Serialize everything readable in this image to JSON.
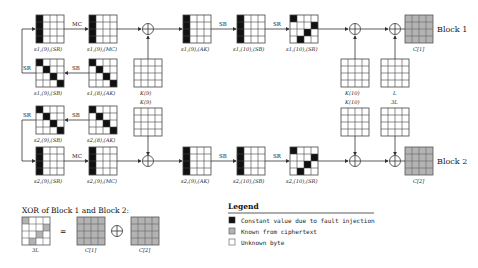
{
  "legend": {
    "title": "Legend",
    "items": [
      {
        "color": "#111111",
        "label": "Constant value due to fault injection"
      },
      {
        "color": "#b3b3b3",
        "label": "Known from ciphertext"
      },
      {
        "color": "#ffffff",
        "label": "Unknown byte"
      }
    ]
  },
  "colors": {
    "fault": "#111111",
    "known": "#b3b3b3",
    "unknown": "#ffffff",
    "line": "#333333"
  },
  "operations": {
    "mc": "MC",
    "sb": "SB",
    "sr": "SR"
  },
  "block1": {
    "name": "Block 1",
    "states": {
      "s9_sr": "s1,(9),(SR)",
      "s9_mc": "s1,(9),(MC)",
      "s9_ak": "s1,(9),(AK)",
      "s10_sb": "s1,(10),(SB)",
      "s10_sr": "s1,(10),(SR)",
      "s9_sb": "s1,(9),(SB)",
      "s8_ak": "s1,(8),(AK)"
    },
    "keys": {
      "k9": "K(9)",
      "k10": "K(10)",
      "tweak": "L"
    },
    "output": "C[1]"
  },
  "block2": {
    "name": "Block 2",
    "states": {
      "s9_sr": "s2,(9),(SR)",
      "s9_mc": "s2,(9),(MC)",
      "s9_ak": "s2,(9),(AK)",
      "s10_sb": "s2,(10),(SB)",
      "s10_sr": "s2,(10),(SR)",
      "s9_sb": "s2,(9),(SB)",
      "s8_ak": "s2,(8),(AK)"
    },
    "keys": {
      "k9": "K(9)",
      "k10": "K(10)",
      "tweak": "3L"
    },
    "output": "C[2]"
  },
  "xor_section": {
    "title": "XOR of Block 1 and Block 2:",
    "result_label": "3L",
    "equals": "=",
    "xor_symbol": "⊕",
    "operand1": "C[1]",
    "operand2": "C[2]"
  }
}
